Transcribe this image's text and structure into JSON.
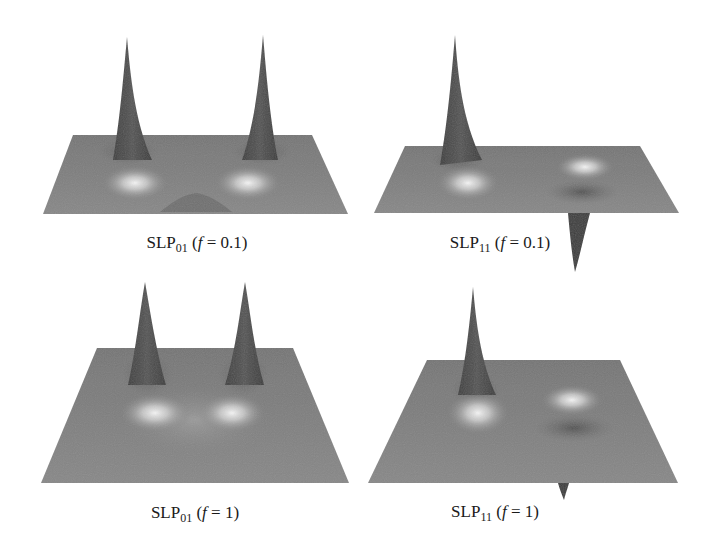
{
  "figure": {
    "panels": [
      {
        "id": "slp01-f01",
        "caption": {
          "base": "SLP",
          "subscript": "01",
          "open": " (",
          "var": "f",
          "eq": " = 0.1)"
        },
        "label": "SLP01 (f = 0.1)"
      },
      {
        "id": "slp11-f01",
        "caption": {
          "base": "SLP",
          "subscript": "11",
          "open": " (",
          "var": "f",
          "eq": " = 0.1)"
        },
        "label": "SLP11 (f = 0.1)"
      },
      {
        "id": "slp01-f1",
        "caption": {
          "base": "SLP",
          "subscript": "01",
          "open": " (",
          "var": "f",
          "eq": " = 1)"
        },
        "label": "SLP01 (f = 1)"
      },
      {
        "id": "slp11-f1",
        "caption": {
          "base": "SLP",
          "subscript": "11",
          "open": " (",
          "var": "f",
          "eq": " = 1)"
        },
        "label": "SLP11 (f = 1)"
      }
    ],
    "colors": {
      "plane": "#7d7d7d",
      "plane_dark": "#6e6e6e",
      "peak": "#4a4a4a",
      "peak_edge": "#333333",
      "highlight": "#f2f2f2",
      "dip": "#555555",
      "caption_text": "#1a1a1a",
      "background": "#ffffff"
    }
  }
}
